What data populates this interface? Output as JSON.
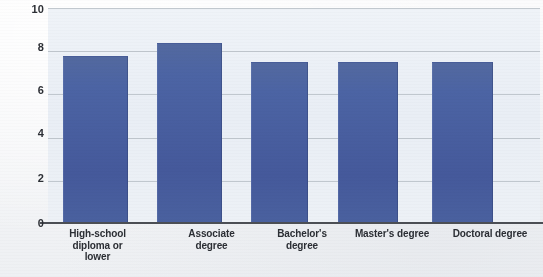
{
  "chart_data": {
    "type": "bar",
    "title": "",
    "subtitle": "",
    "xlabel": "",
    "ylabel": "",
    "categories": [
      "High-school diploma or lower",
      "Associate degree",
      "Bachelor's degree",
      "Master's degree",
      "Doctoral degree"
    ],
    "category_lines": [
      [
        "High-school",
        "diploma or",
        "lower"
      ],
      [
        "Associate",
        "degree"
      ],
      [
        "Bachelor's",
        "degree"
      ],
      [
        "Master's degree"
      ],
      [
        "Doctoral degree"
      ]
    ],
    "values": [
      7.8,
      8.4,
      7.5,
      7.5,
      7.5
    ],
    "ylim": [
      0,
      10
    ],
    "ytick_labels": [
      "10",
      "8",
      "6",
      "4",
      "2",
      "0"
    ],
    "ytick_values": [
      10,
      8,
      6,
      4,
      2,
      0
    ],
    "grid": true,
    "grid_axis": "y",
    "legend": false,
    "legend_position": "none",
    "bar_color": "#4c64a4",
    "plot_background": "#eef2f7",
    "axis_color": "#4c4f55",
    "gridline_color": "#b9bfc7",
    "text_color": "#2b2e34"
  }
}
